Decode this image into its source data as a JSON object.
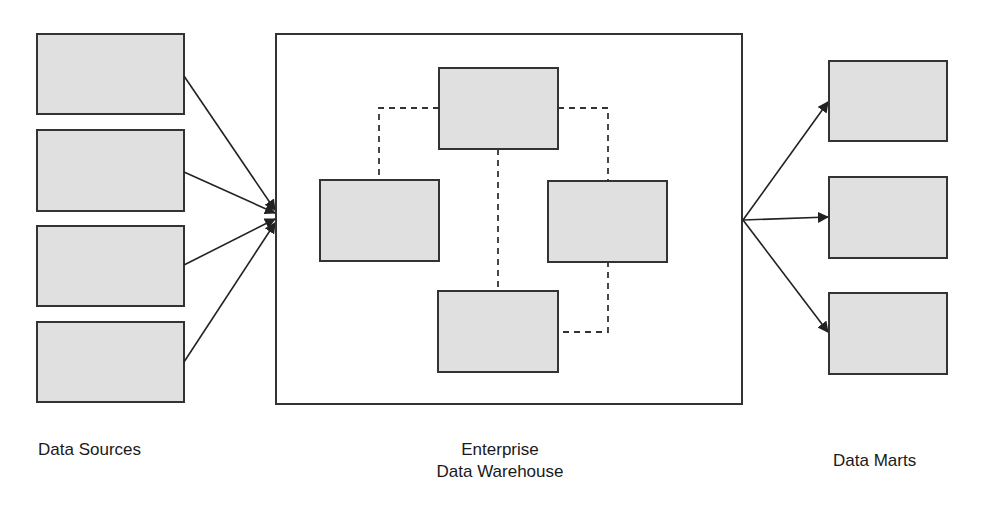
{
  "diagram": {
    "type": "architecture",
    "colors": {
      "box_fill": "#e0e0e0",
      "box_stroke": "#333333",
      "line": "#222222",
      "background": "#ffffff"
    },
    "labels": {
      "sources": "Data Sources",
      "warehouse_line1": "Enterprise",
      "warehouse_line2": "Data Warehouse",
      "marts": "Data Marts"
    },
    "sources": [
      {
        "id": "source-1",
        "label": ""
      },
      {
        "id": "source-2",
        "label": ""
      },
      {
        "id": "source-3",
        "label": ""
      },
      {
        "id": "source-4",
        "label": ""
      }
    ],
    "warehouse": {
      "components": [
        {
          "id": "wh-top",
          "label": ""
        },
        {
          "id": "wh-left",
          "label": ""
        },
        {
          "id": "wh-right",
          "label": ""
        },
        {
          "id": "wh-bottom",
          "label": ""
        }
      ],
      "connections": [
        {
          "from": "wh-top",
          "to": "wh-left",
          "style": "dashed"
        },
        {
          "from": "wh-top",
          "to": "wh-right",
          "style": "dashed"
        },
        {
          "from": "wh-top",
          "to": "wh-bottom",
          "style": "dashed"
        },
        {
          "from": "wh-right",
          "to": "wh-bottom",
          "style": "dashed"
        }
      ]
    },
    "marts": [
      {
        "id": "mart-1",
        "label": ""
      },
      {
        "id": "mart-2",
        "label": ""
      },
      {
        "id": "mart-3",
        "label": ""
      }
    ],
    "edges": [
      {
        "from": "source-1",
        "to": "warehouse",
        "arrow": true
      },
      {
        "from": "source-2",
        "to": "warehouse",
        "arrow": true
      },
      {
        "from": "source-3",
        "to": "warehouse",
        "arrow": true
      },
      {
        "from": "source-4",
        "to": "warehouse",
        "arrow": true
      },
      {
        "from": "warehouse",
        "to": "mart-1",
        "arrow": true
      },
      {
        "from": "warehouse",
        "to": "mart-2",
        "arrow": true
      },
      {
        "from": "warehouse",
        "to": "mart-3",
        "arrow": true
      }
    ]
  }
}
